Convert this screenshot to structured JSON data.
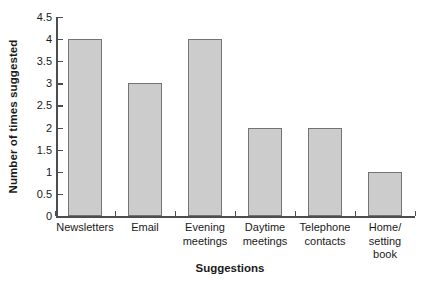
{
  "chart_data": {
    "type": "bar",
    "title": "",
    "xlabel": "Suggestions",
    "ylabel": "Number of times suggested",
    "categories": [
      "Newsletters",
      "Email",
      "Evening meetings",
      "Daytime meetings",
      "Telephone contacts",
      "Home/ setting book"
    ],
    "category_lines": [
      [
        "Newsletters"
      ],
      [
        "Email"
      ],
      [
        "Evening",
        "meetings"
      ],
      [
        "Daytime",
        "meetings"
      ],
      [
        "Telephone",
        "contacts"
      ],
      [
        "Home/",
        "setting",
        "book"
      ]
    ],
    "values": [
      4,
      3,
      4,
      2,
      2,
      1
    ],
    "ylim": [
      0,
      4.5
    ],
    "ytick_labels": [
      "0",
      "0.5",
      "1",
      "1.5",
      "2",
      "2.5",
      "3",
      "3.5",
      "4",
      "4.5"
    ],
    "ytick_values": [
      0,
      0.5,
      1,
      1.5,
      2,
      2.5,
      3,
      3.5,
      4,
      4.5
    ],
    "grid": false,
    "legend": null,
    "bar_fill_color": "#cccccc",
    "bar_edge_color": "#737373",
    "axis_color": "#4d4d4d",
    "background_color": "#ffffff",
    "text_color": "#1a1a1a"
  }
}
